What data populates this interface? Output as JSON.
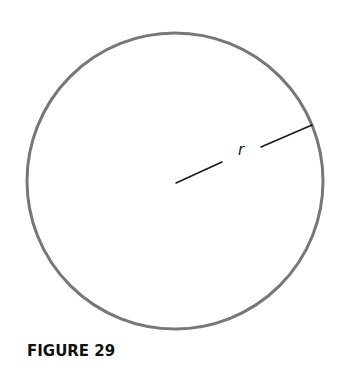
{
  "figure": {
    "caption": "FIGURE 29",
    "circle": {
      "center_x": 175,
      "center_y": 181,
      "radius": 148,
      "stroke_color": "#777777",
      "stroke_width": 3
    },
    "radius_line": {
      "label": "r",
      "color": "#1a1a1a",
      "segment_1": {
        "x1": 176,
        "y1": 183,
        "x2": 222,
        "y2": 162
      },
      "segment_2": {
        "x1": 261,
        "y1": 147,
        "x2": 312,
        "y2": 125
      }
    }
  }
}
